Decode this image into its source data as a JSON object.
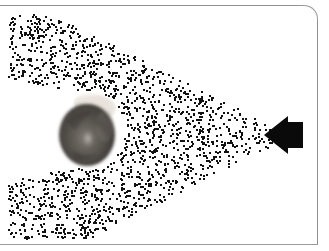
{
  "figure": {
    "title": "Directional acoustic beam incident on a listener's head",
    "caption": "",
    "background_color": "#ffffff",
    "width": 329,
    "height": 251
  },
  "frame": {
    "rule_color": "#9a9a9a",
    "top_rule_label": "page-rule-top",
    "bottom_rule_label": "page-rule-bottom",
    "right_rule_label": "page-rule-right",
    "corner_radius": 14
  },
  "emitter": {
    "label": "loudspeaker-emitter",
    "color": "#0a0a0a",
    "x": 263,
    "y": 116,
    "width": 41,
    "height": 38,
    "direction": "left",
    "cone_apex_x": 288,
    "cone_apex_y": 135
  },
  "subject": {
    "label": "listener-head-top-view",
    "x": 55,
    "y": 92,
    "width": 68,
    "height": 76,
    "hair_color": "#4e4a48",
    "skin_color": "#efeae4",
    "crown_highlight_color": "#b9b2ab"
  },
  "beam": {
    "label": "stipple-particle-beam",
    "dot_color": "#111111",
    "dot_size": 2,
    "dot_count": 1650,
    "apex_x": 290,
    "apex_y": 135,
    "half_angle_deg": 27,
    "left_extent_x": 8,
    "occluder_enabled": true,
    "seed": 20240517
  },
  "chart_data": {
    "type": "scatter",
    "title": "Directional acoustic beam incident on a listener's head",
    "xlabel": "",
    "ylabel": "",
    "xlim": [
      0,
      329
    ],
    "ylim": [
      0,
      251
    ],
    "grid": false,
    "legend": "none",
    "annotations": [
      {
        "name": "loudspeaker-emitter",
        "x": 288,
        "y": 135,
        "text": ""
      },
      {
        "name": "listener-head",
        "x": 89,
        "y": 130,
        "text": ""
      }
    ],
    "series": [
      {
        "name": "beam-particles",
        "marker": "square",
        "color": "#111111",
        "size": 2,
        "n": 1650,
        "distribution": "uniform-within-cone-minus-head-shadow"
      }
    ]
  }
}
